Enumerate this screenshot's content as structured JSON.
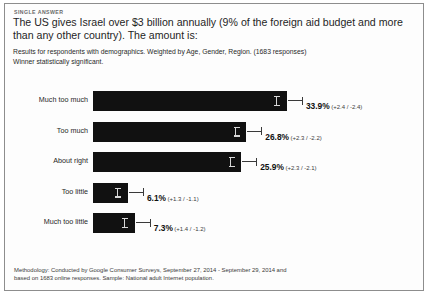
{
  "card": {
    "kicker": "SINGLE ANSWER",
    "question": "The US gives Israel over $3 billion annually (9% of the foreign aid budget and more than any other country). The amount is:",
    "subnote_line1": "Results for respondents with demographics. Weighted by Age, Gender, Region. (1683 responses)",
    "subnote_line2": "Winner statistically significant.",
    "methodology_line1": "Methodology: Conducted by Google Consumer Surveys, September 27, 2014 - September 29, 2014 and",
    "methodology_line2": "based on 1683 online responses. Sample: National adult Internet population.",
    "bar_color": "#111111",
    "border_color": "#8d8d8d"
  },
  "chart_data": {
    "type": "bar",
    "orientation": "horizontal",
    "title": "The US gives Israel over $3 billion annually (9% of the foreign aid budget and more than any other country). The amount is:",
    "xlabel": "",
    "ylabel": "",
    "xlim": [
      0,
      40
    ],
    "grid": false,
    "legend": false,
    "responses": 1683,
    "categories": [
      "Much too much",
      "Too much",
      "About right",
      "Too little",
      "Much too little"
    ],
    "values": [
      33.9,
      26.8,
      25.9,
      6.1,
      7.3
    ],
    "value_labels": [
      "33.9%",
      "26.8%",
      "25.9%",
      "6.1%",
      "7.3%"
    ],
    "error_high": [
      2.4,
      2.3,
      2.3,
      1.3,
      1.4
    ],
    "error_low": [
      2.4,
      2.2,
      2.1,
      1.1,
      1.2
    ],
    "error_labels": [
      "(+2.4 / -2.4)",
      "(+2.3 / -2.2)",
      "(+2.3 / -2.1)",
      "(+1.3 / -1.1)",
      "(+1.4 / -1.2)"
    ]
  }
}
